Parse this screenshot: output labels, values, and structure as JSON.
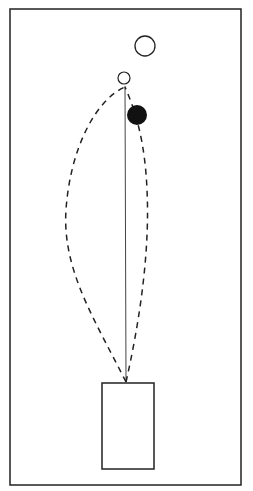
{
  "diagram": {
    "colors": {
      "stroke": "#222222",
      "background": "#ffffff",
      "filled": "#111111"
    },
    "field": {
      "x": 10,
      "y": 9,
      "w": 231,
      "h": 476
    },
    "box": {
      "x": 102,
      "y": 383,
      "w": 52,
      "h": 86
    },
    "top_circle": {
      "cx": 145,
      "cy": 46,
      "r": 10
    },
    "small_circle": {
      "cx": 124,
      "cy": 78,
      "r": 6
    },
    "filled_circle": {
      "cx": 137,
      "cy": 115,
      "r": 10
    }
  }
}
